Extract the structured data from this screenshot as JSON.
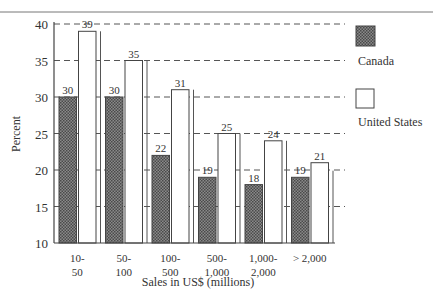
{
  "chart_data": {
    "type": "bar",
    "title": "",
    "xlabel": "Sales in US$ (millions)",
    "ylabel": "Percent",
    "ylim": [
      10,
      40
    ],
    "yticks": [
      10,
      15,
      20,
      25,
      30,
      35,
      40
    ],
    "grid": "horizontal dashed",
    "legend_position": "right",
    "categories": [
      [
        "10-",
        "50"
      ],
      [
        "50-",
        "100"
      ],
      [
        "100-",
        "500"
      ],
      [
        "500-",
        "1,000"
      ],
      [
        "1,000-",
        "2,000"
      ],
      [
        "> 2,000"
      ]
    ],
    "series": [
      {
        "name": "Canada",
        "fill": "hatched-gray",
        "color": "#6b6b6b",
        "values": [
          30,
          30,
          22,
          19,
          18,
          19
        ]
      },
      {
        "name": "United States",
        "fill": "white",
        "color": "#ffffff",
        "values": [
          39,
          35,
          31,
          25,
          24,
          21
        ]
      }
    ]
  },
  "legend": {
    "items": [
      {
        "label": "Canada"
      },
      {
        "label": "United States"
      }
    ]
  }
}
